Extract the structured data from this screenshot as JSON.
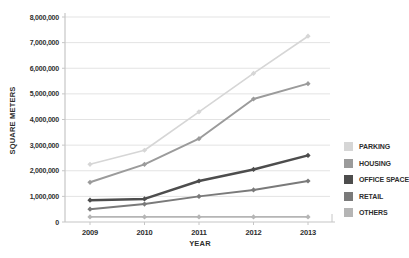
{
  "chart_data": {
    "type": "line",
    "title": "",
    "xlabel": "YEAR",
    "ylabel": "SQUARE METERS",
    "categories": [
      "2009",
      "2010",
      "2011",
      "2012",
      "2013"
    ],
    "ylim": [
      0,
      8000000
    ],
    "y_tick_step": 1000000,
    "y_tick_labels": [
      "0",
      "1,000,000",
      "2,000,000",
      "3,000,000",
      "4,000,000",
      "5,000,000",
      "6,000,000",
      "7,000,000",
      "8,000,000"
    ],
    "grid": true,
    "legend_position": "right",
    "series": [
      {
        "name": "PARKING",
        "color": "#d6d6d6",
        "values": [
          2250000,
          2800000,
          4300000,
          5800000,
          7250000
        ]
      },
      {
        "name": "HOUSING",
        "color": "#9b9b9b",
        "values": [
          1550000,
          2250000,
          3250000,
          4800000,
          5400000
        ]
      },
      {
        "name": "OFFICE SPACE",
        "color": "#4d4d4d",
        "values": [
          850000,
          900000,
          1600000,
          2050000,
          2600000
        ]
      },
      {
        "name": "RETAIL",
        "color": "#7a7a7a",
        "values": [
          500000,
          700000,
          1000000,
          1250000,
          1600000
        ]
      },
      {
        "name": "OTHERS",
        "color": "#b5b5b5",
        "values": [
          200000,
          200000,
          200000,
          200000,
          200000
        ]
      }
    ]
  },
  "colors": {
    "background": "#ffffff",
    "grid": "#e3e3e3",
    "axis": "#c6c6c6",
    "text": "#2e2e2e"
  }
}
